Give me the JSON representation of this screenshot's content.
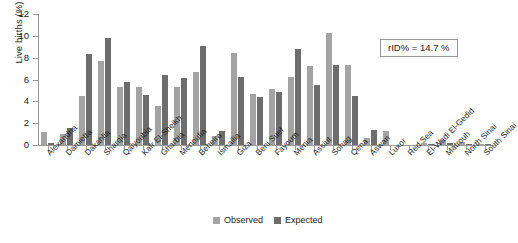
{
  "chart_data": {
    "type": "bar",
    "title": "",
    "xlabel": "",
    "ylabel": "Live births (%)",
    "ylim": [
      0,
      12
    ],
    "yticks": [
      0,
      2,
      4,
      6,
      8,
      10,
      12
    ],
    "grid": false,
    "legend_position": "bottom-center",
    "categories": [
      "Alexandria",
      "Damietta",
      "Dakahlia",
      "Sharqia",
      "Qalyoubia",
      "Kafr El-Sheikh",
      "Gharbia",
      "Menoufia",
      "Beheira",
      "Ismailia",
      "Giza",
      "Beni Suef",
      "Fayoum",
      "Menia",
      "Assiut",
      "Sohag",
      "Qena",
      "Aswan",
      "Luxor",
      "Red Sea",
      "El-Wadi El-Gedid",
      "Matrouh",
      "North Sinai",
      "South Sinai"
    ],
    "series": [
      {
        "name": "Observed",
        "color": "#a3a3a3",
        "values": [
          1.2,
          1.0,
          4.5,
          7.7,
          5.3,
          5.3,
          3.6,
          5.3,
          6.7,
          0.85,
          8.4,
          4.7,
          5.1,
          6.2,
          7.2,
          10.3,
          7.3,
          0.6,
          1.3,
          0.0,
          0.15,
          0.45,
          0.3,
          0.1
        ]
      },
      {
        "name": "Expected",
        "color": "#6d6d6d",
        "values": [
          0.15,
          1.6,
          8.3,
          9.8,
          5.8,
          4.6,
          6.4,
          6.1,
          9.1,
          1.25,
          6.2,
          4.4,
          4.9,
          8.8,
          5.5,
          7.3,
          4.5,
          1.4,
          0.0,
          0.0,
          0.05,
          0.2,
          0.1,
          0.05
        ]
      }
    ],
    "annotation": "rID% = 14.7 %"
  },
  "legend": {
    "items": [
      {
        "label": "Observed",
        "color": "#a3a3a3"
      },
      {
        "label": "Expected",
        "color": "#6d6d6d"
      }
    ]
  }
}
